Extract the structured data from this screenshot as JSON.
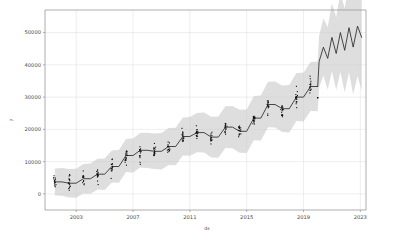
{
  "chart_data": {
    "type": "line",
    "title": "",
    "xlabel": "ds",
    "ylabel": "y",
    "xlim": [
      2000.8,
      2023.4
    ],
    "ylim": [
      -5000,
      57000
    ],
    "xticks": [
      2003,
      2007,
      2011,
      2015,
      2019,
      2023
    ],
    "xticklabels": [
      "2003",
      "2007",
      "2011",
      "2015",
      "2019",
      "2023"
    ],
    "yticks": [
      0,
      10000,
      20000,
      30000,
      40000,
      50000
    ],
    "yticklabels": [
      "0",
      "10000",
      "20000",
      "30000",
      "40000",
      "50000"
    ],
    "grid": true,
    "legend": null,
    "colors": {
      "trend": "#2b2b2b",
      "uncertainty_band": "#c9c9c9",
      "observations": "#101010",
      "grid": "#d9d9d9",
      "axis": "#9a9a9a",
      "background": "#ffffff"
    },
    "series": [
      {
        "name": "yhat",
        "note": "piecewise-constant yearly trend with step jumps; oscillating seasonal forecast after 2020",
        "x": [
          2001.5,
          2002.0,
          2002.5,
          2003.0,
          2003.5,
          2004.0,
          2004.5,
          2005.0,
          2005.5,
          2006.0,
          2006.5,
          2007.0,
          2007.5,
          2008.0,
          2008.5,
          2009.0,
          2009.5,
          2010.0,
          2010.5,
          2011.0,
          2011.5,
          2012.0,
          2012.5,
          2013.0,
          2013.5,
          2014.0,
          2014.5,
          2015.0,
          2015.5,
          2016.0,
          2016.5,
          2017.0,
          2017.5,
          2018.0,
          2018.5,
          2019.0,
          2019.5,
          2020.0
        ],
        "y": [
          3700,
          3700,
          3300,
          3300,
          4700,
          4700,
          6100,
          6100,
          8500,
          8500,
          11900,
          11900,
          13500,
          13500,
          13200,
          13200,
          14700,
          14700,
          17800,
          17800,
          19000,
          19000,
          17600,
          17600,
          20700,
          20700,
          19400,
          19400,
          23500,
          23500,
          27700,
          27700,
          26400,
          26400,
          30000,
          30000,
          33300,
          33300
        ]
      },
      {
        "name": "yhat-forecast",
        "note": "oscillating forecast tail",
        "x": [
          2020.1,
          2020.4,
          2020.7,
          2021.0,
          2021.3,
          2021.6,
          2021.9,
          2022.2,
          2022.5,
          2022.8,
          2023.1
        ],
        "y": [
          41000,
          45500,
          42000,
          48500,
          43500,
          50000,
          44500,
          51500,
          45500,
          52000,
          48500
        ]
      }
    ],
    "uncertainty": {
      "name": "yhat_lower / yhat_upper",
      "description": "grey shaded 80% prediction interval widening with time"
    },
    "observations": {
      "name": "y (actual)",
      "description": "black scatter points clustered vertically at each yearly timestamp",
      "count_approx": 330,
      "value_range": [
        2500,
        42000
      ]
    },
    "annotations": [
      {
        "label": "outlier",
        "x": 2020.0,
        "y": 29800
      }
    ]
  },
  "figure": {
    "ylabel": "y",
    "xlabel": "ds"
  }
}
